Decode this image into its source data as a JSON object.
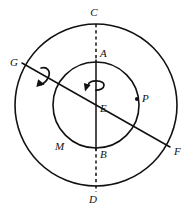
{
  "figure": {
    "background_color": "#ffffff",
    "stroke_color": "#111111",
    "width": 192,
    "height": 215
  },
  "circles": {
    "center": {
      "x": 96,
      "y": 105
    },
    "outer": {
      "radius": 81,
      "label": "outer-circle"
    },
    "inner": {
      "radius": 43,
      "label": "inner-circle"
    }
  },
  "axes": {
    "vertical": {
      "name": "vertical-axis",
      "top_label": "C",
      "bottom_label": "D",
      "inner_top_label": "A",
      "inner_bottom_label": "B",
      "dashed_segments": [
        "C-A",
        "B-D"
      ],
      "solid_segments": [
        "A-B"
      ]
    },
    "diagonal": {
      "name": "diagonal-axis",
      "left_label": "G",
      "right_label": "F",
      "style": "solid"
    }
  },
  "points": [
    {
      "id": "C",
      "label": "C",
      "x": 96,
      "y": 24,
      "label_x": 94,
      "label_y": 16,
      "dot": false
    },
    {
      "id": "A",
      "label": "A",
      "x": 96,
      "y": 62,
      "label_x": 100,
      "label_y": 57,
      "dot": false
    },
    {
      "id": "E",
      "label": "E",
      "x": 96,
      "y": 105,
      "label_x": 100,
      "label_y": 112,
      "dot": false
    },
    {
      "id": "P",
      "label": "P",
      "x": 137,
      "y": 99,
      "label_x": 142,
      "label_y": 102,
      "dot": true
    },
    {
      "id": "F",
      "label": "F",
      "x": 170,
      "y": 147,
      "label_x": 174,
      "label_y": 155,
      "dot": false
    },
    {
      "id": "G",
      "label": "G",
      "x": 22,
      "y": 63,
      "label_x": 10,
      "label_y": 66,
      "dot": false
    },
    {
      "id": "M",
      "label": "M",
      "x": 60,
      "y": 146,
      "label_x": 55,
      "label_y": 150,
      "dot": false
    },
    {
      "id": "B",
      "label": "B",
      "x": 96,
      "y": 148,
      "label_x": 100,
      "label_y": 158,
      "dot": false
    },
    {
      "id": "D",
      "label": "D",
      "x": 96,
      "y": 192,
      "label_x": 93,
      "label_y": 203,
      "dot": false
    }
  ],
  "rotation_arrows": [
    {
      "id": "center-rotation",
      "about": "vertical-axis",
      "x": 92,
      "y": 84,
      "name": "rotation-arrow-vertical"
    },
    {
      "id": "diagonal-rotation",
      "about": "diagonal-axis",
      "x": 44,
      "y": 74,
      "name": "rotation-arrow-diagonal"
    }
  ]
}
